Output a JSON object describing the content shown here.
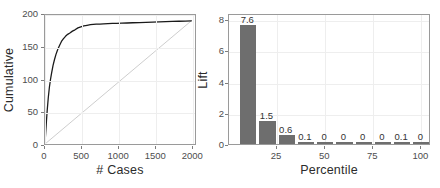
{
  "figure": {
    "background": "#ffffff",
    "panel_border_color": "#9a9a9a",
    "grid_color": "#eeeeee"
  },
  "chart_data": [
    {
      "id": "cumulative-gains",
      "type": "line",
      "title": "",
      "xlabel": "# Cases",
      "ylabel": "Cumulative",
      "xlim": [
        0,
        2050
      ],
      "ylim": [
        0,
        200
      ],
      "xticks": [
        0,
        500,
        1000,
        1500,
        2000
      ],
      "xticklabels": [
        "0",
        "500",
        "1000",
        "1500",
        "2000"
      ],
      "yticks": [
        0,
        50,
        100,
        150,
        200
      ],
      "yticklabels": [
        "0",
        "50",
        "100",
        "150",
        "200"
      ],
      "grid": true,
      "legend": "none",
      "series": [
        {
          "name": "Cumulative gains curve",
          "color": "#1a1a1a",
          "x": [
            0,
            10,
            20,
            30,
            45,
            60,
            75,
            90,
            110,
            130,
            150,
            175,
            200,
            225,
            250,
            280,
            310,
            340,
            375,
            410,
            450,
            490,
            530,
            575,
            620,
            660,
            700,
            750,
            800,
            860,
            920,
            980,
            1050,
            1120,
            1200,
            1290,
            1380,
            1470,
            1560,
            1650,
            1740,
            1830,
            1920,
            2000
          ],
          "y": [
            2,
            18,
            36,
            52,
            72,
            88,
            100,
            110,
            122,
            131,
            139,
            147,
            153,
            159,
            163,
            167,
            170,
            172,
            175,
            177,
            180,
            181.5,
            183,
            184,
            185,
            185.5,
            186,
            186,
            186.3,
            186.6,
            187,
            187,
            187.3,
            187.6,
            188,
            188.2,
            188.5,
            189,
            189.3,
            189.6,
            190,
            190.3,
            190.6,
            191
          ]
        },
        {
          "name": "Baseline diagonal",
          "color": "#cccccc",
          "x": [
            0,
            2000
          ],
          "y": [
            0,
            191
          ]
        }
      ]
    },
    {
      "id": "lift-by-percentile",
      "type": "bar",
      "title": "",
      "xlabel": "Percentile",
      "ylabel": "Lift",
      "xlim": [
        0,
        105
      ],
      "ylim": [
        0,
        8.4
      ],
      "xticks": [
        25,
        50,
        75,
        100
      ],
      "xticklabels": [
        "25",
        "50",
        "75",
        "100"
      ],
      "yticks": [
        0,
        2,
        4,
        6,
        8
      ],
      "yticklabels": [
        "0",
        "2",
        "4",
        "6",
        "8"
      ],
      "grid": true,
      "legend": "none",
      "bar_color": "#6e6e6e",
      "categories": [
        10,
        20,
        30,
        40,
        50,
        60,
        70,
        80,
        90,
        100
      ],
      "values": [
        7.6,
        1.5,
        0.6,
        0.1,
        0,
        0,
        0,
        0,
        0.1,
        0
      ],
      "data_labels": [
        "7.6",
        "1.5",
        "0.6",
        "0.1",
        "0",
        "0",
        "0",
        "0",
        "0.1",
        "0"
      ]
    }
  ]
}
